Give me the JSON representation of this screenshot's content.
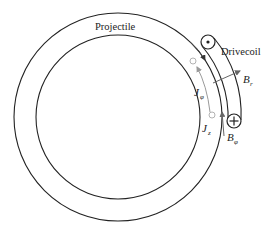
{
  "diagram": {
    "labels": {
      "projectile": "Projectile",
      "drivecoil": "Drivecoil",
      "j_phi": "J",
      "j_phi_sub": "φ",
      "j_z": "J",
      "j_z_sub": "z",
      "b_r": "B",
      "b_r_sub": "r",
      "b_phi": "B",
      "b_phi_sub": "φ"
    },
    "symbols": {
      "coil_top": "current-out-of-page (dot)",
      "coil_bottom": "current-into-page (plus/cross)"
    },
    "colors": {
      "line": "#222222",
      "gray_arrow": "#9a9a9a",
      "br_arrow": "#666666"
    }
  }
}
